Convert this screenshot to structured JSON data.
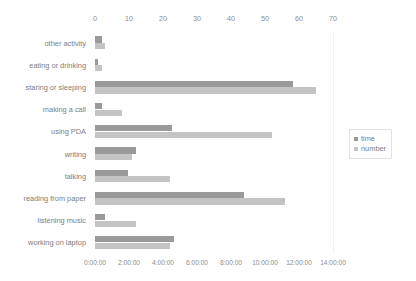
{
  "chart_data": {
    "type": "bar",
    "orientation": "horizontal",
    "title": "",
    "xlabel": "",
    "ylabel": "",
    "grid": false,
    "legend_position": "right",
    "categories": [
      "other activity",
      "eating or drinking",
      "staring or sleeping",
      "making a call",
      "using PDA",
      "writing",
      "talking",
      "reading from paper",
      "listening music",
      "working on laptop"
    ],
    "series": [
      {
        "name": "time",
        "axis": "bottom",
        "color": "#9a9a9a",
        "unit": "h:mm:ss",
        "values_label": [
          "0:25:00",
          "0:10:00",
          "11:40:00",
          "0:25:00",
          "4:30:00",
          "2:25:00",
          "1:55:00",
          "8:45:00",
          "0:35:00",
          "4:40:00"
        ],
        "values_hours": [
          0.42,
          0.17,
          11.67,
          0.42,
          4.5,
          2.42,
          1.92,
          8.75,
          0.58,
          4.67
        ]
      },
      {
        "name": "number",
        "axis": "top",
        "color": "#c4c4c4",
        "unit": "count",
        "values": [
          3,
          2,
          65,
          8,
          52,
          11,
          22,
          56,
          12,
          22
        ]
      }
    ],
    "axis_top": {
      "label": "number",
      "ticks": [
        "0",
        "10",
        "20",
        "30",
        "40",
        "50",
        "60",
        "70"
      ],
      "min": 0,
      "max": 70
    },
    "axis_bottom": {
      "label": "time",
      "ticks": [
        "0:00:00",
        "2:00:00",
        "4:00:00",
        "6:00:00",
        "8:00:00",
        "10:00:00",
        "12:00:00",
        "14:00:00"
      ],
      "min_hours": 0,
      "max_hours": 14
    }
  },
  "legend": {
    "items": [
      {
        "label": "time",
        "color": "#9a9a9a"
      },
      {
        "label": "number",
        "color": "#c4c4c4"
      }
    ]
  }
}
